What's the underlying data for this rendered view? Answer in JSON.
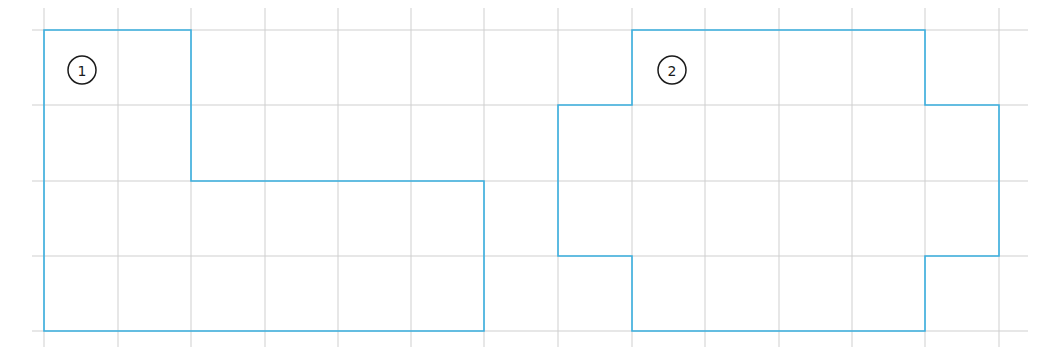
{
  "grid": {
    "x_lines": [
      44,
      118,
      191,
      265,
      338,
      411,
      484,
      558,
      632,
      705,
      779,
      852,
      925,
      999
    ],
    "y_lines": [
      30,
      105,
      181,
      256,
      331
    ],
    "x_extent": [
      32,
      1028
    ],
    "y_extent": [
      8,
      347
    ],
    "color": "#cfcfcf"
  },
  "shapes": [
    {
      "label": "1",
      "label_pos": [
        82,
        70
      ],
      "outline_color": "#3ab0e0",
      "points": "44,30 191,30 191,181 484,181 484,331 44,331"
    },
    {
      "label": "2",
      "label_pos": [
        672,
        70
      ],
      "outline_color": "#3ab0e0",
      "points": "632,30 925,30 925,105 999,105 999,256 925,256 925,331 632,331 632,256 558,256 558,105 632,105"
    }
  ]
}
